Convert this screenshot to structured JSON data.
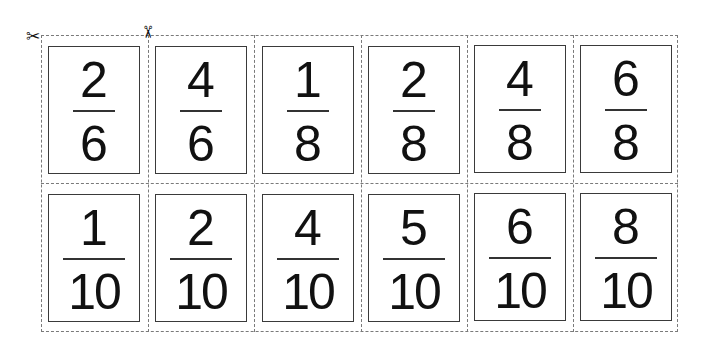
{
  "icons": [
    "scissors-icon-top-left",
    "scissors-icon-top"
  ],
  "rows": [
    [
      {
        "numerator": "2",
        "denominator": "6"
      },
      {
        "numerator": "4",
        "denominator": "6"
      },
      {
        "numerator": "1",
        "denominator": "8"
      },
      {
        "numerator": "2",
        "denominator": "8"
      },
      {
        "numerator": "4",
        "denominator": "8"
      },
      {
        "numerator": "6",
        "denominator": "8"
      }
    ],
    [
      {
        "numerator": "1",
        "denominator": "10"
      },
      {
        "numerator": "2",
        "denominator": "10"
      },
      {
        "numerator": "4",
        "denominator": "10"
      },
      {
        "numerator": "5",
        "denominator": "10"
      },
      {
        "numerator": "6",
        "denominator": "10"
      },
      {
        "numerator": "8",
        "denominator": "10"
      }
    ]
  ],
  "colors": {
    "cut_line": "#7a7a7a",
    "card_border": "#3a3a3a",
    "text": "#111111"
  }
}
